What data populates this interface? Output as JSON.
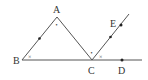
{
  "figure": {
    "points": [
      {
        "id": "A",
        "label": "A"
      },
      {
        "id": "B",
        "label": "B"
      },
      {
        "id": "C",
        "label": "C"
      },
      {
        "id": "D",
        "label": "D"
      },
      {
        "id": "E",
        "label": "E"
      }
    ],
    "segments": [
      "AB",
      "AC",
      "BD",
      "CE"
    ],
    "angle_marks": {
      "A": "•",
      "B": "×",
      "ACB": "•",
      "ECD": "×"
    },
    "colors": {
      "line": "#555555",
      "point": "#222222",
      "text": "#333333"
    }
  }
}
